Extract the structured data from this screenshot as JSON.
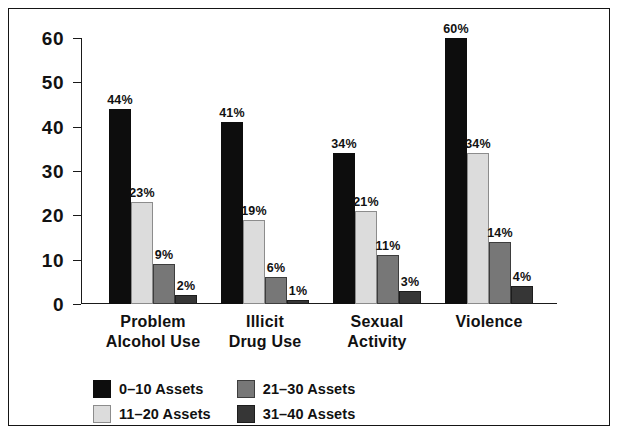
{
  "chart_data": {
    "type": "bar",
    "title": "",
    "subtitle": "",
    "xlabel": "",
    "ylabel": "",
    "ylim": [
      0,
      60
    ],
    "yticks": [
      0,
      10,
      20,
      30,
      40,
      50,
      60
    ],
    "ytick_labels": [
      "0",
      "10",
      "20",
      "30",
      "40",
      "50",
      "60"
    ],
    "grid": false,
    "legend_position": "bottom-left",
    "categories": [
      "Problem\nAlcohol Use",
      "Illicit\nDrug Use",
      "Sexual\nActivity",
      "Violence"
    ],
    "series": [
      {
        "name": "0–10 Assets",
        "color": "#0d0d0d",
        "border": "#0d0d0d",
        "values": [
          44,
          41,
          34,
          60
        ],
        "labels": [
          "44%",
          "41%",
          "34%",
          "60%"
        ]
      },
      {
        "name": "11–20 Assets",
        "color": "#dcdcdc",
        "border": "#8c8c8c",
        "values": [
          23,
          19,
          21,
          34
        ],
        "labels": [
          "23%",
          "19%",
          "21%",
          "34%"
        ]
      },
      {
        "name": "21–30 Assets",
        "color": "#777777",
        "border": "#3d3d3d",
        "values": [
          9,
          6,
          11,
          14
        ],
        "labels": [
          "9%",
          "6%",
          "11%",
          "14%"
        ]
      },
      {
        "name": "31–40 Assets",
        "color": "#363636",
        "border": "#1d1d1d",
        "values": [
          2,
          1,
          3,
          4
        ],
        "labels": [
          "2%",
          "1%",
          "3%",
          "4%"
        ]
      }
    ]
  },
  "axis": {
    "tick_0": "0",
    "tick_10": "10",
    "tick_20": "20",
    "tick_30": "30",
    "tick_40": "40",
    "tick_50": "50",
    "tick_60": "60"
  },
  "categories": {
    "c0": "Problem\nAlcohol Use",
    "c1": "Illicit\nDrug Use",
    "c2": "Sexual\nActivity",
    "c3": "Violence"
  },
  "legend": {
    "items": [
      {
        "label": "0–10 Assets",
        "color": "#0d0d0d",
        "border": "#0d0d0d"
      },
      {
        "label": "21–30 Assets",
        "color": "#777777",
        "border": "#3d3d3d"
      },
      {
        "label": "11–20 Assets",
        "color": "#dcdcdc",
        "border": "#8c8c8c"
      },
      {
        "label": "31–40 Assets",
        "color": "#363636",
        "border": "#1d1d1d"
      }
    ]
  },
  "colors": {
    "frame": "#151515",
    "axis": "#1a1a1a",
    "text": "#111111",
    "background": "#ffffff"
  }
}
